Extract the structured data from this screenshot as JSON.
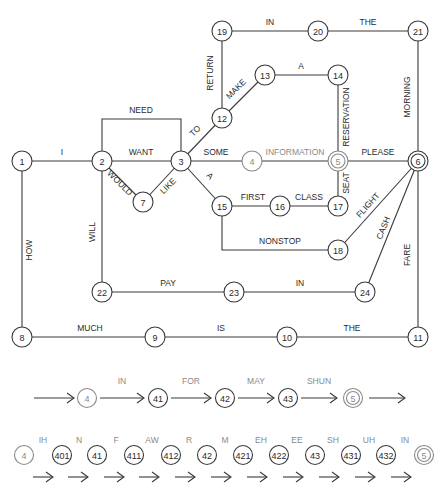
{
  "diagram": {
    "main_network": {
      "nodes": [
        {
          "id": "1",
          "label": "1",
          "x": 22,
          "y": 161,
          "style": "normal"
        },
        {
          "id": "2",
          "label": "2",
          "x": 102,
          "y": 161,
          "style": "normal"
        },
        {
          "id": "3",
          "label": "3",
          "x": 181,
          "y": 161,
          "style": "normal"
        },
        {
          "id": "4",
          "label": "4",
          "x": 252,
          "y": 161,
          "style": "gray"
        },
        {
          "id": "5",
          "label": "5",
          "x": 338,
          "y": 161,
          "style": "double-gray"
        },
        {
          "id": "6",
          "label": "6",
          "x": 418,
          "y": 161,
          "style": "double"
        },
        {
          "id": "7",
          "label": "7",
          "x": 143,
          "y": 202,
          "style": "normal"
        },
        {
          "id": "8",
          "label": "8",
          "x": 22,
          "y": 337,
          "style": "normal"
        },
        {
          "id": "9",
          "label": "9",
          "x": 155,
          "y": 337,
          "style": "normal"
        },
        {
          "id": "10",
          "label": "10",
          "x": 287,
          "y": 337,
          "style": "normal"
        },
        {
          "id": "11",
          "label": "11",
          "x": 418,
          "y": 337,
          "style": "normal"
        },
        {
          "id": "12",
          "label": "12",
          "x": 222,
          "y": 118,
          "style": "normal"
        },
        {
          "id": "13",
          "label": "13",
          "x": 265,
          "y": 75,
          "style": "normal"
        },
        {
          "id": "14",
          "label": "14",
          "x": 338,
          "y": 75,
          "style": "normal"
        },
        {
          "id": "15",
          "label": "15",
          "x": 222,
          "y": 206,
          "style": "normal"
        },
        {
          "id": "16",
          "label": "16",
          "x": 280,
          "y": 206,
          "style": "normal"
        },
        {
          "id": "17",
          "label": "17",
          "x": 338,
          "y": 206,
          "style": "normal"
        },
        {
          "id": "18",
          "label": "18",
          "x": 338,
          "y": 250,
          "style": "normal"
        },
        {
          "id": "19",
          "label": "19",
          "x": 222,
          "y": 31,
          "style": "normal"
        },
        {
          "id": "20",
          "label": "20",
          "x": 318,
          "y": 31,
          "style": "normal"
        },
        {
          "id": "21",
          "label": "21",
          "x": 418,
          "y": 31,
          "style": "normal"
        },
        {
          "id": "22",
          "label": "22",
          "x": 102,
          "y": 292,
          "style": "normal"
        },
        {
          "id": "23",
          "label": "23",
          "x": 234,
          "y": 292,
          "style": "normal"
        },
        {
          "id": "24",
          "label": "24",
          "x": 365,
          "y": 292,
          "style": "normal"
        }
      ],
      "edges": [
        {
          "from": "1",
          "to": "2",
          "label": "I",
          "path": "M22,161 L102,161",
          "lx": 62,
          "ly": 155,
          "rot": 0
        },
        {
          "from": "2",
          "to": "3",
          "label": "WANT",
          "path": "M102,161 L181,161",
          "lx": 141,
          "ly": 155,
          "rot": 0
        },
        {
          "from": "2",
          "to": "3",
          "label": "NEED",
          "path": "M102,161 L102,119 L181,119 L181,161",
          "lx": 141,
          "ly": 113,
          "rot": 0
        },
        {
          "from": "2",
          "to": "7",
          "label": "WOULD",
          "path": "M102,161 L143,202",
          "lx": 118,
          "ly": 185,
          "rot": 45
        },
        {
          "from": "7",
          "to": "3",
          "label": "LIKE",
          "path": "M143,202 L181,161",
          "lx": 170,
          "ly": 188,
          "rot": -45
        },
        {
          "from": "3",
          "to": "4",
          "label": "SOME",
          "path": "M181,161 L252,161",
          "lx": 216,
          "ly": 155,
          "rot": 0
        },
        {
          "from": "4",
          "to": "5",
          "label": "INFORMATION",
          "path": "M252,161 L338,161",
          "lx": 295,
          "ly": 155,
          "rot": 0,
          "gray": true
        },
        {
          "from": "5",
          "to": "6",
          "label": "PLEASE",
          "path": "M338,161 L418,161",
          "lx": 378,
          "ly": 155,
          "rot": 0
        },
        {
          "from": "3",
          "to": "12",
          "label": "TO",
          "path": "M181,161 L222,118",
          "lx": 197,
          "ly": 133,
          "rot": -45
        },
        {
          "from": "12",
          "to": "19",
          "label": "RETURN",
          "path": "M222,118 L222,31",
          "lx": 213,
          "ly": 73,
          "rot": -90
        },
        {
          "from": "12",
          "to": "13",
          "label": "MAKE",
          "path": "M222,118 L265,75",
          "lx": 238,
          "ly": 91,
          "rot": -45
        },
        {
          "from": "13",
          "to": "14",
          "label": "A",
          "path": "M265,75 L338,75",
          "lx": 301,
          "ly": 69,
          "rot": 0
        },
        {
          "from": "14",
          "to": "5",
          "label": "RESERVATION",
          "path": "M338,75 L338,161",
          "lx": 349,
          "ly": 117,
          "rot": -90
        },
        {
          "from": "19",
          "to": "20",
          "label": "IN",
          "path": "M222,31 L318,31",
          "lx": 270,
          "ly": 25,
          "rot": 0
        },
        {
          "from": "20",
          "to": "21",
          "label": "THE",
          "path": "M318,31 L418,31",
          "lx": 368,
          "ly": 25,
          "rot": 0
        },
        {
          "from": "21",
          "to": "6",
          "label": "MORNING",
          "path": "M418,31 L418,161",
          "lx": 410,
          "ly": 97,
          "rot": -90
        },
        {
          "from": "3",
          "to": "15",
          "label": "A",
          "path": "M181,161 L222,206",
          "lx": 208,
          "ly": 178,
          "rot": 45
        },
        {
          "from": "15",
          "to": "16",
          "label": "FIRST",
          "path": "M222,206 L280,206",
          "lx": 253,
          "ly": 200,
          "rot": 0
        },
        {
          "from": "16",
          "to": "17",
          "label": "CLASS",
          "path": "M280,206 L338,206",
          "lx": 309,
          "ly": 200,
          "rot": 0
        },
        {
          "from": "17",
          "to": "5",
          "label": "SEAT",
          "path": "M338,206 L338,161",
          "lx": 349,
          "ly": 183,
          "rot": -90
        },
        {
          "from": "15",
          "to": "18",
          "label": "NONSTOP",
          "path": "M222,206 L222,250 L338,250",
          "lx": 280,
          "ly": 244,
          "rot": 0
        },
        {
          "from": "18",
          "to": "6",
          "label": "FLIGHT",
          "path": "M338,250 L418,161",
          "lx": 370,
          "ly": 207,
          "rot": -48
        },
        {
          "from": "24",
          "to": "6",
          "label": "CASH",
          "path": "M365,292 L418,161",
          "lx": 386,
          "ly": 229,
          "rot": -68
        },
        {
          "from": "2",
          "to": "22",
          "label": "WILL",
          "path": "M102,161 L102,292",
          "lx": 95,
          "ly": 232,
          "rot": -90
        },
        {
          "from": "22",
          "to": "23",
          "label": "PAY",
          "path": "M102,292 L234,292",
          "lx": 168,
          "ly": 286,
          "rot": 0
        },
        {
          "from": "23",
          "to": "24",
          "label": "IN",
          "path": "M234,292 L365,292",
          "lx": 300,
          "ly": 286,
          "rot": 0
        },
        {
          "from": "1",
          "to": "8",
          "label": "HOW",
          "path": "M22,161 L22,337",
          "lx": 32,
          "ly": 250,
          "rot": -90
        },
        {
          "from": "8",
          "to": "9",
          "label": "MUCH",
          "path": "M22,337 L155,337",
          "lx": 90,
          "ly": 331,
          "rot": 0
        },
        {
          "from": "9",
          "to": "10",
          "label": "IS",
          "path": "M155,337 L287,337",
          "lx": 221,
          "ly": 331,
          "rot": 0
        },
        {
          "from": "10",
          "to": "11",
          "label": "THE",
          "path": "M287,337 L418,337",
          "lx": 352,
          "ly": 331,
          "rot": 0
        },
        {
          "from": "11",
          "to": "6",
          "label": "FARE",
          "path": "M418,337 L418,161",
          "lx": 410,
          "ly": 255,
          "rot": -90
        }
      ]
    },
    "word_expansion": {
      "nodes": [
        {
          "label": "4",
          "x": 87,
          "y": 398,
          "style": "gray"
        },
        {
          "label": "41",
          "x": 158,
          "y": 398,
          "style": "normal"
        },
        {
          "label": "42",
          "x": 225,
          "y": 398,
          "style": "normal"
        },
        {
          "label": "43",
          "x": 288,
          "y": 398,
          "style": "normal"
        },
        {
          "label": "5",
          "x": 353,
          "y": 398,
          "style": "double-gray"
        }
      ],
      "arrows": [
        {
          "x1": 34,
          "x2": 74,
          "y": 398,
          "label": ""
        },
        {
          "x1": 100,
          "x2": 144,
          "y": 398,
          "label": "IN"
        },
        {
          "x1": 171,
          "x2": 211,
          "y": 398,
          "label": "FOR"
        },
        {
          "x1": 238,
          "x2": 274,
          "y": 398,
          "label": "MAY"
        },
        {
          "x1": 301,
          "x2": 337,
          "y": 398,
          "label": "SHUN"
        },
        {
          "x1": 369,
          "x2": 405,
          "y": 398,
          "label": ""
        }
      ]
    },
    "phone_expansion": {
      "nodes": [
        {
          "label": "4",
          "x": 24,
          "y": 455,
          "style": "gray"
        },
        {
          "label": "401",
          "x": 62,
          "y": 455,
          "style": "normal"
        },
        {
          "label": "41",
          "x": 97,
          "y": 455,
          "style": "normal"
        },
        {
          "label": "411",
          "x": 134,
          "y": 455,
          "style": "normal"
        },
        {
          "label": "412",
          "x": 171,
          "y": 455,
          "style": "normal"
        },
        {
          "label": "42",
          "x": 207,
          "y": 455,
          "style": "normal"
        },
        {
          "label": "421",
          "x": 243,
          "y": 455,
          "style": "normal"
        },
        {
          "label": "422",
          "x": 279,
          "y": 455,
          "style": "normal"
        },
        {
          "label": "43",
          "x": 315,
          "y": 455,
          "style": "normal"
        },
        {
          "label": "431",
          "x": 351,
          "y": 455,
          "style": "normal"
        },
        {
          "label": "432",
          "x": 386,
          "y": 455,
          "style": "normal"
        },
        {
          "label": "5",
          "x": 424,
          "y": 455,
          "style": "double-gray"
        }
      ],
      "labels": [
        {
          "text": "IH",
          "x": 43,
          "y": 443
        },
        {
          "text": "N",
          "x": 79,
          "y": 443
        },
        {
          "text": "F",
          "x": 116,
          "y": 443
        },
        {
          "text": "AW",
          "x": 152,
          "y": 443
        },
        {
          "text": "R",
          "x": 189,
          "y": 443
        },
        {
          "text": "M",
          "x": 225,
          "y": 443
        },
        {
          "text": "EH",
          "x": 261,
          "y": 443
        },
        {
          "text": "EE",
          "x": 297,
          "y": 443
        },
        {
          "text": "SH",
          "x": 333,
          "y": 443
        },
        {
          "text": "UH",
          "x": 369,
          "y": 443
        },
        {
          "text": "IN",
          "x": 405,
          "y": 443
        }
      ],
      "arrows": [
        {
          "x1": 33,
          "x2": 53,
          "y": 477
        },
        {
          "x1": 68,
          "x2": 88,
          "y": 477
        },
        {
          "x1": 104,
          "x2": 124,
          "y": 477
        },
        {
          "x1": 139,
          "x2": 159,
          "y": 477
        },
        {
          "x1": 175,
          "x2": 195,
          "y": 477
        },
        {
          "x1": 211,
          "x2": 231,
          "y": 477
        },
        {
          "x1": 247,
          "x2": 267,
          "y": 477
        },
        {
          "x1": 283,
          "x2": 303,
          "y": 477
        },
        {
          "x1": 319,
          "x2": 339,
          "y": 477
        },
        {
          "x1": 355,
          "x2": 375,
          "y": 477
        },
        {
          "x1": 391,
          "x2": 411,
          "y": 477
        }
      ]
    }
  }
}
